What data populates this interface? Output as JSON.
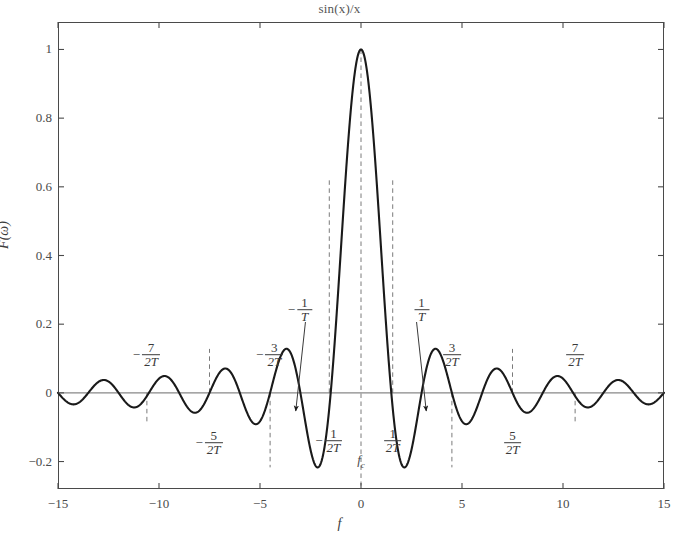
{
  "chart_data": {
    "type": "line",
    "title": "sin(x)/x",
    "xlabel": "f",
    "ylabel": "F(ω)",
    "xlim": [
      -15,
      15
    ],
    "ylim": [
      -0.28,
      1.08
    ],
    "grid": false,
    "legend": null,
    "series": [
      {
        "name": "sinc",
        "formula": "sin(x)/x",
        "x": [
          -15.0,
          -14.7,
          -14.4,
          -14.1,
          -13.8,
          -13.5,
          -13.2,
          -12.9,
          -12.6,
          -12.3,
          -12.0,
          -11.7,
          -11.4,
          -11.1,
          -10.8,
          -10.5,
          -10.2,
          -9.9,
          -9.6,
          -9.3,
          -9.0,
          -8.7,
          -8.4,
          -8.1,
          -7.8,
          -7.5,
          -7.2,
          -6.9,
          -6.6,
          -6.3,
          -6.0,
          -5.7,
          -5.4,
          -5.1,
          -4.8,
          -4.5,
          -4.2,
          -3.9,
          -3.6,
          -3.3,
          -3.0,
          -2.7,
          -2.4,
          -2.1,
          -1.8,
          -1.5,
          -1.2,
          -0.9,
          -0.6,
          -0.3,
          0.0,
          0.3,
          0.6,
          0.9,
          1.2,
          1.5,
          1.8,
          2.1,
          2.4,
          2.7,
          3.0,
          3.3,
          3.6,
          3.9,
          4.2,
          4.5,
          4.8,
          5.1,
          5.4,
          5.7,
          6.0,
          6.3,
          6.6,
          6.9,
          7.2,
          7.5,
          7.8,
          8.1,
          8.4,
          8.7,
          9.0,
          9.3,
          9.6,
          9.9,
          10.2,
          10.5,
          10.8,
          11.1,
          11.4,
          11.7,
          12.0,
          12.3,
          12.6,
          12.9,
          13.2,
          13.5,
          13.8,
          14.1,
          14.4,
          14.7,
          15.0
        ],
        "y": [
          0.043,
          0.068,
          0.068,
          0.046,
          0.009,
          -0.031,
          -0.065,
          -0.083,
          -0.08,
          -0.057,
          -0.018,
          0.026,
          0.063,
          0.082,
          0.079,
          0.054,
          0.013,
          -0.032,
          -0.07,
          -0.089,
          -0.046,
          -0.083,
          -0.09,
          -0.062,
          -0.013,
          0.04,
          0.08,
          0.096,
          0.083,
          0.046,
          -0.047,
          -0.088,
          -0.143,
          -0.18,
          -0.196,
          -0.217,
          -0.207,
          -0.176,
          -0.123,
          -0.048,
          0.047,
          0.158,
          0.281,
          0.411,
          0.541,
          0.665,
          0.777,
          0.87,
          0.941,
          0.985,
          1.0,
          0.985,
          0.941,
          0.87,
          0.777,
          0.665,
          0.541,
          0.411,
          0.281,
          0.158,
          0.047,
          -0.048,
          -0.123,
          -0.176,
          -0.207,
          -0.217,
          -0.196,
          -0.18,
          -0.143,
          -0.088,
          -0.047,
          0.046,
          0.083,
          0.096,
          0.08,
          0.04,
          -0.013,
          -0.062,
          -0.09,
          -0.083,
          -0.046,
          -0.089,
          -0.07,
          -0.032,
          0.013,
          0.054,
          0.079,
          0.082,
          0.063,
          0.026,
          -0.018,
          -0.057,
          -0.08,
          -0.083,
          -0.065,
          -0.031,
          0.009,
          0.046,
          0.068,
          0.068,
          0.043
        ]
      }
    ],
    "yticks": [
      {
        "value": 1,
        "label": "1"
      },
      {
        "value": 0.8,
        "label": "0.8"
      },
      {
        "value": 0.6,
        "label": "0.6"
      },
      {
        "value": 0.4,
        "label": "0.4"
      },
      {
        "value": 0.2,
        "label": "0.2"
      },
      {
        "value": 0,
        "label": "0"
      },
      {
        "value": -0.2,
        "label": "−0.2"
      }
    ],
    "xticks": [
      {
        "value": -15,
        "label": "−15"
      },
      {
        "value": -10,
        "label": "−10"
      },
      {
        "value": -5,
        "label": "−5"
      },
      {
        "value": 0,
        "label": "0"
      },
      {
        "value": 5,
        "label": "5"
      },
      {
        "value": 10,
        "label": "10"
      },
      {
        "value": 15,
        "label": "15"
      }
    ],
    "zero_line": {
      "y": 0,
      "color": "#888888"
    },
    "annotations": [
      {
        "name": "neg-seven-over-2T",
        "sign": "−",
        "num": "7",
        "den": "2T",
        "x": -10.6,
        "y_px": 355,
        "dash_x": -10.6,
        "dash_from": 0,
        "dash_to": -0.083
      },
      {
        "name": "neg-five-over-2T",
        "sign": "−",
        "num": "5",
        "den": "2T",
        "x": -7.5,
        "y_px": 443,
        "dash_x": -7.5,
        "dash_from": 0,
        "dash_to": 0.128
      },
      {
        "name": "neg-three-over-2T",
        "sign": "−",
        "num": "3",
        "den": "2T",
        "x": -4.5,
        "y_px": 355,
        "dash_x": -4.5,
        "dash_from": 0,
        "dash_to": -0.217
      },
      {
        "name": "neg-one-over-T",
        "sign": "−",
        "num": "1",
        "den": "T",
        "x": -3.0,
        "y_px": 310,
        "arrow": true
      },
      {
        "name": "neg-one-over-2T",
        "sign": "−",
        "num": "1",
        "den": "2T",
        "x": -1.57,
        "y_px": 441,
        "dash_x": -1.57,
        "dash_from": 0,
        "dash_to": 0.62
      },
      {
        "name": "pos-one-over-2T",
        "sign": "",
        "num": "1",
        "den": "2T",
        "x": 1.57,
        "y_px": 441,
        "dash_x": 1.57,
        "dash_from": 0,
        "dash_to": 0.62
      },
      {
        "name": "pos-one-over-T",
        "sign": "",
        "num": "1",
        "den": "T",
        "x": 3.0,
        "y_px": 310,
        "arrow": true
      },
      {
        "name": "pos-three-over-2T",
        "sign": "",
        "num": "3",
        "den": "2T",
        "x": 4.5,
        "y_px": 355,
        "dash_x": 4.5,
        "dash_from": 0,
        "dash_to": -0.217
      },
      {
        "name": "pos-five-over-2T",
        "sign": "",
        "num": "5",
        "den": "2T",
        "x": 7.5,
        "y_px": 443,
        "dash_x": 7.5,
        "dash_from": 0,
        "dash_to": 0.128
      },
      {
        "name": "pos-seven-over-2T",
        "sign": "",
        "num": "7",
        "den": "2T",
        "x": 10.6,
        "y_px": 355,
        "dash_x": 10.6,
        "dash_from": 0,
        "dash_to": -0.083
      }
    ],
    "center_marker": {
      "label": "f",
      "subscript": "c",
      "x": 0
    },
    "arrow_targets": [
      {
        "name": "neg-one-over-T-arrow",
        "from_x": -2.75,
        "from_y_px": 322,
        "to_x": -3.23,
        "to_y_px": 411
      },
      {
        "name": "pos-one-over-T-arrow",
        "from_x": 2.75,
        "from_y_px": 322,
        "to_x": 3.23,
        "to_y_px": 411
      }
    ],
    "colors": {
      "curve": "#1a1a1a",
      "frame": "#4a4a4a",
      "dashed": "#7a7a7a",
      "zero_line": "#8a8a8a",
      "text": "#3a3a3a",
      "background": "#ffffff"
    }
  }
}
